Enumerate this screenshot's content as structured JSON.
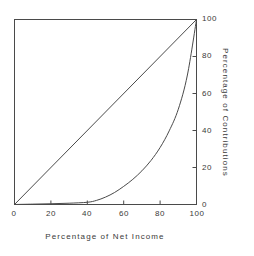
{
  "figure": {
    "background_color": "#ffffff",
    "line_color": "#4a4a4a",
    "text_color": "#3a3a3a"
  },
  "axes": {
    "x_title": "Percentage of Net Income",
    "y_title": "Percentage of Contributions",
    "x_tick_labels": [
      "0",
      "20",
      "40",
      "60",
      "80",
      "100"
    ],
    "y_tick_labels": [
      "0",
      "20",
      "40",
      "60",
      "80",
      "100"
    ],
    "y_axis_side": "right"
  },
  "chart_data": {
    "type": "line",
    "title": "",
    "subtitle": "",
    "xlabel": "Percentage of Net Income",
    "ylabel": "Percentage of Contributions",
    "xlim": [
      0,
      100
    ],
    "ylim": [
      0,
      100
    ],
    "xticks": [
      0,
      20,
      40,
      60,
      80,
      100
    ],
    "yticks": [
      0,
      20,
      40,
      60,
      80,
      100
    ],
    "grid": false,
    "legend": "none",
    "y_axis_position": "right",
    "tick_direction": "in",
    "annotations": [],
    "series": [
      {
        "name": "line-of-equality",
        "x": [
          0,
          100
        ],
        "values": [
          0,
          100
        ]
      },
      {
        "name": "lorenz-curve",
        "x": [
          0,
          10,
          20,
          30,
          40,
          45,
          50,
          55,
          60,
          65,
          70,
          75,
          80,
          85,
          90,
          95,
          100
        ],
        "values": [
          0,
          0.2,
          0.4,
          0.7,
          1.2,
          2.2,
          4.0,
          6.5,
          9.8,
          13.6,
          18.2,
          23.8,
          30.8,
          39.8,
          51.5,
          70.0,
          100
        ]
      }
    ]
  }
}
